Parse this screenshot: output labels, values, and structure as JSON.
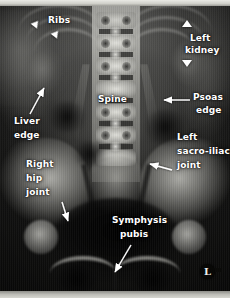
{
  "figure": {
    "kind": "annotated-radiograph",
    "modality": "plain-film-x-ray",
    "view": "supine abdomen / pelvis AP",
    "width_px": 230,
    "height_px": 298,
    "annotation_color": "#ffffff",
    "background_color": "#0d0d0c",
    "film_border_color": "#c9c9c4"
  },
  "annotations": [
    {
      "id": "ribs",
      "label": "Ribs",
      "marker": "arrowheads",
      "count": 2
    },
    {
      "id": "left-kidney",
      "label": "Left\nkidney",
      "marker": "arrowheads",
      "count": 2
    },
    {
      "id": "liver-edge",
      "label": "Liver\nedge",
      "marker": "arrow",
      "count": 1
    },
    {
      "id": "spine",
      "label": "Spine",
      "marker": "none",
      "count": 0
    },
    {
      "id": "psoas-edge",
      "label": "Psoas\nedge",
      "marker": "arrow",
      "count": 1
    },
    {
      "id": "left-sij",
      "label": "Left\nsacro-iliac\njoint",
      "marker": "arrow",
      "count": 1
    },
    {
      "id": "right-hip-joint",
      "label": "Right\nhip\njoint",
      "marker": "arrow",
      "count": 1
    },
    {
      "id": "symphysis-pubis",
      "label": "Symphysis\npubis",
      "marker": "arrow",
      "count": 1
    }
  ],
  "labels": {
    "ribs": "Ribs",
    "left_kidney_line1": "Left",
    "left_kidney_line2": "kidney",
    "liver_edge_line1": "Liver",
    "liver_edge_line2": "edge",
    "spine": "Spine",
    "psoas_edge_line1": "Psoas",
    "psoas_edge_line2": "edge",
    "sij_line1": "Left",
    "sij_line2": "sacro-iliac",
    "sij_line3": "joint",
    "hip_line1": "Right",
    "hip_line2": "hip",
    "hip_line3": "joint",
    "symphysis_line1": "Symphysis",
    "symphysis_line2": "pubis"
  },
  "side_marker": {
    "text": "L",
    "meaning": "left-side radiographic marker"
  }
}
